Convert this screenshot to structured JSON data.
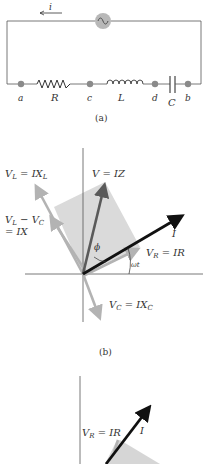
{
  "circuit": {
    "current_label": "i",
    "nodes": [
      "a",
      "c",
      "d",
      "b"
    ],
    "components": [
      "R",
      "L",
      "C"
    ],
    "caption": "(a)"
  },
  "phasor_b": {
    "labels": {
      "vl": "V",
      "vl_sub": "L",
      "vl_eq": " = IX",
      "vl_eq_sub": "L",
      "v": "V = IZ",
      "vlvc_1": "V",
      "vlvc_1_sub": "L",
      "vlvc_mid": " − V",
      "vlvc_mid_sub": "C",
      "vlvc_2": "= IX",
      "i": "I",
      "phi": "ϕ",
      "vr": "V",
      "vr_sub": "R",
      "vr_eq": " = IR",
      "wt": "ωt",
      "vc": "V",
      "vc_sub": "C",
      "vc_eq": " = IX",
      "vc_eq_sub": "C"
    },
    "caption": "(b)"
  },
  "phasor_c": {
    "labels": {
      "vr": "V",
      "vr_sub": "R",
      "vr_eq": " = IR",
      "i": "I"
    }
  },
  "colors": {
    "wire": "#555555",
    "node": "#8a8a8a",
    "source_fill": "#b8b8b8",
    "light_arrow": "#b3b3b3",
    "dark_arrow": "#5a5a5a",
    "current_arrow": "#111111",
    "shade": "#d6d6d6"
  }
}
